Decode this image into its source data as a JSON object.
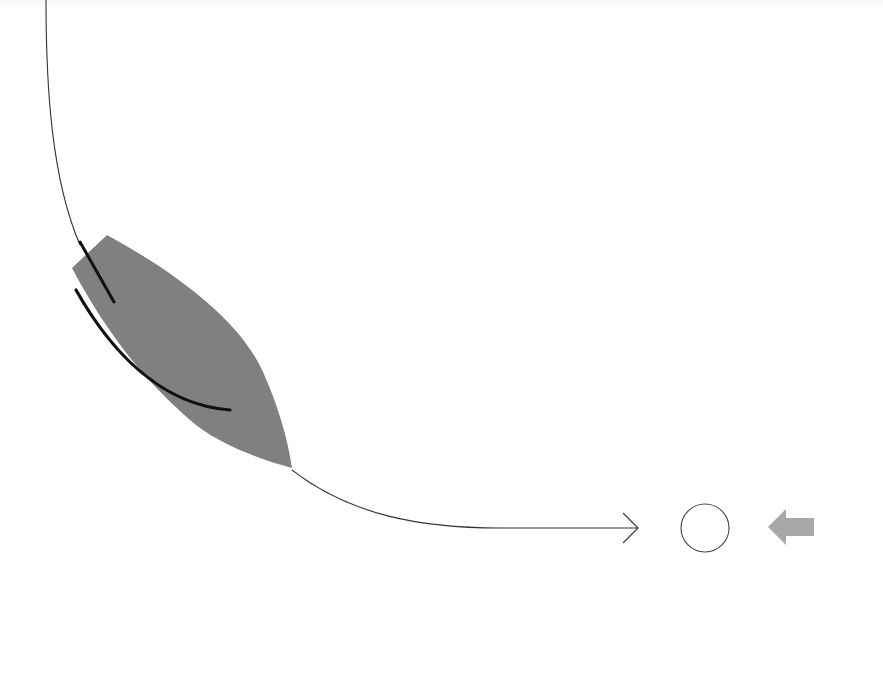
{
  "diagram": {
    "background": "#ffffff",
    "elements": [
      {
        "id": "curve-path",
        "type": "curve-arrow",
        "description": "thin curved path descending from top-left and sweeping right into a horizontal arrow",
        "stroke": "#333333"
      },
      {
        "id": "leaf-shape",
        "type": "filled-shape",
        "description": "grey leaf/blade shape along the curve",
        "fill": "#808080"
      },
      {
        "id": "short-stroke",
        "type": "stroke",
        "description": "short thick black stroke on upper part of leaf",
        "stroke": "#111111"
      },
      {
        "id": "long-stroke",
        "type": "stroke",
        "description": "long curved thick black stroke along lower edge of leaf",
        "stroke": "#111111"
      },
      {
        "id": "circle",
        "type": "circle-outline",
        "description": "empty circle after arrowhead",
        "stroke": "#444444"
      },
      {
        "id": "back-arrow",
        "type": "block-arrow-left",
        "description": "grey left-pointing block arrow",
        "fill": "#a8a8a8"
      }
    ]
  }
}
